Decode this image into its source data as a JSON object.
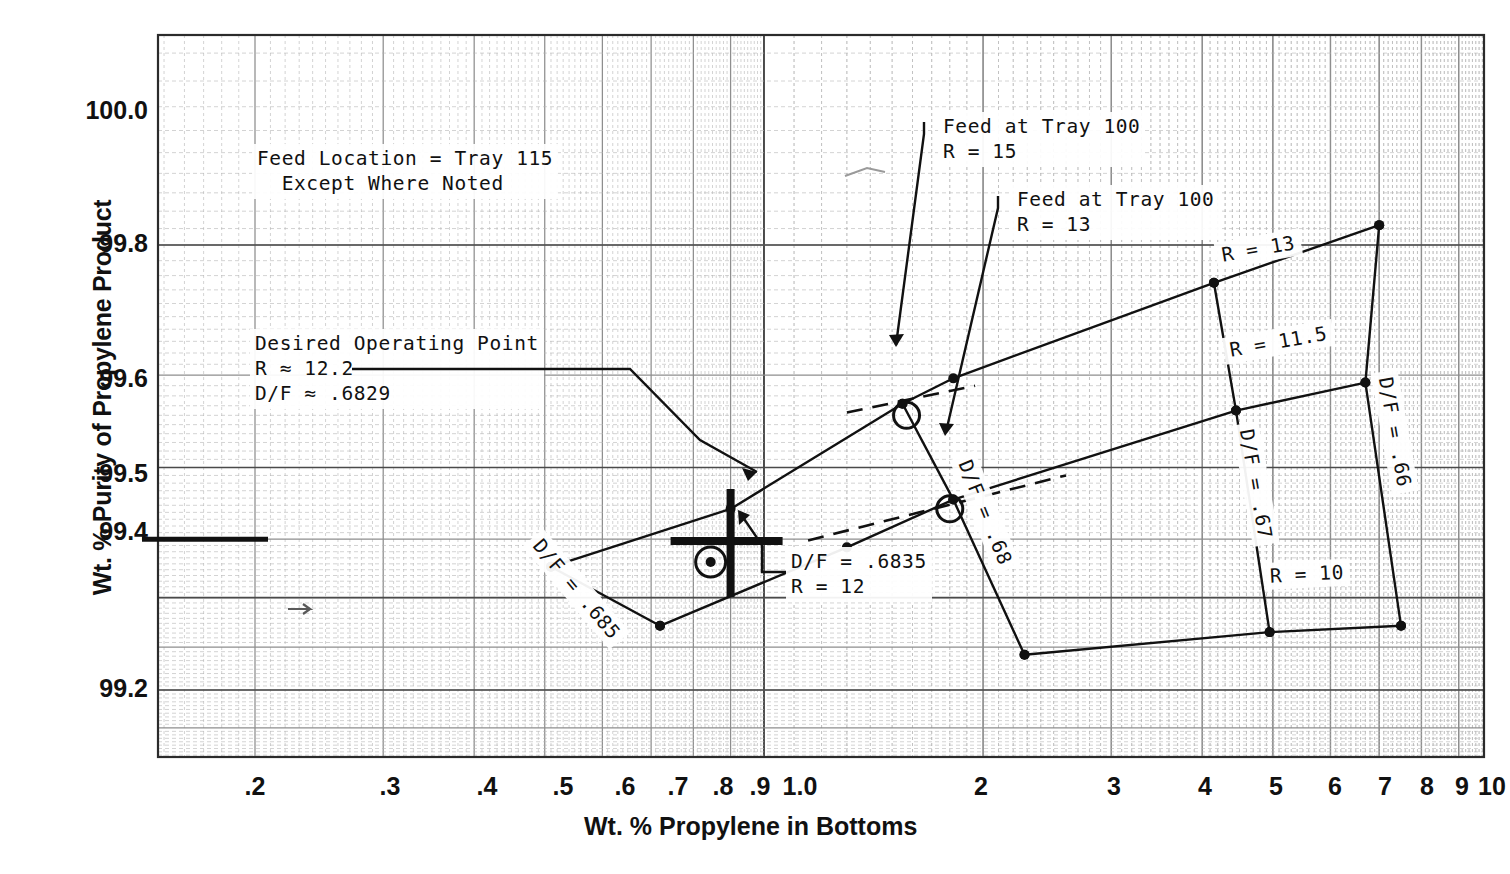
{
  "chart_data": {
    "type": "line",
    "title": "",
    "xlabel": "Wt. % Propylene in Bottoms",
    "ylabel": "Wt. % Purity of Propylene Product",
    "x_scale": "log",
    "xlim": [
      0.15,
      10
    ],
    "y_scale": "log-of-impurity",
    "ylim": [
      99.1,
      100.05
    ],
    "grid": true,
    "legend": "none",
    "x_ticks": [
      ".2",
      ".3",
      ".4",
      ".5",
      ".6",
      ".7",
      ".8",
      ".9",
      "1.0",
      "2",
      "3",
      "4",
      "5",
      "6",
      "7",
      "8",
      "9",
      "10"
    ],
    "y_ticks": [
      "100.0",
      "99.8",
      "99.6",
      "99.5",
      "99.4",
      "99.2"
    ],
    "series": [
      {
        "name": "R = 13",
        "label": "R = 13",
        "points": [
          {
            "x": 0.51,
            "y": 99.455
          },
          {
            "x": 0.9,
            "y": 99.545
          },
          {
            "x": 1.55,
            "y": 99.672
          },
          {
            "x": 1.82,
            "y": 99.697
          },
          {
            "x": 4.15,
            "y": 99.775
          },
          {
            "x": 7.0,
            "y": 99.812
          }
        ]
      },
      {
        "name": "R = 11.5",
        "label": "R = 11.5",
        "points": [
          {
            "x": 0.72,
            "y": 99.345
          },
          {
            "x": 1.3,
            "y": 99.487
          },
          {
            "x": 1.82,
            "y": 99.558
          },
          {
            "x": 4.45,
            "y": 99.665
          },
          {
            "x": 6.7,
            "y": 99.693
          }
        ]
      },
      {
        "name": "R = 10",
        "label": "R = 10",
        "points": [
          {
            "x": 2.28,
            "y": 99.283
          },
          {
            "x": 4.95,
            "y": 99.332
          },
          {
            "x": 7.5,
            "y": 99.345
          }
        ]
      },
      {
        "name": "D/F = .685",
        "label": "D/F = .685",
        "points": [
          {
            "x": 0.51,
            "y": 99.455
          },
          {
            "x": 0.72,
            "y": 99.345
          }
        ]
      },
      {
        "name": "D/F = .68",
        "label": "D/F = .68",
        "points": [
          {
            "x": 1.55,
            "y": 99.672
          },
          {
            "x": 1.82,
            "y": 99.558
          },
          {
            "x": 2.28,
            "y": 99.283
          }
        ]
      },
      {
        "name": "D/F = .67",
        "label": "D/F = .67",
        "points": [
          {
            "x": 4.15,
            "y": 99.775
          },
          {
            "x": 4.45,
            "y": 99.665
          },
          {
            "x": 4.95,
            "y": 99.332
          }
        ]
      },
      {
        "name": "D/F = .66",
        "label": "D/F = .66",
        "points": [
          {
            "x": 7.0,
            "y": 99.812
          },
          {
            "x": 6.7,
            "y": 99.693
          },
          {
            "x": 7.5,
            "y": 99.345
          }
        ]
      }
    ],
    "dashed_series": [
      {
        "name": "feed-tray-100-upper",
        "points": [
          {
            "x": 1.3,
            "y": 99.663
          },
          {
            "x": 1.95,
            "y": 99.69
          }
        ]
      },
      {
        "name": "feed-tray-100-lower",
        "points": [
          {
            "x": 1.15,
            "y": 99.498
          },
          {
            "x": 2.6,
            "y": 99.59
          }
        ]
      }
    ],
    "annotations": {
      "feed_location": "Feed Location = Tray 115\n  Except Where Noted",
      "desired_operating_point": "Desired Operating Point\nR ≈ 12.2\nD/F ≈ .6829",
      "feed_tray_100_r15": "Feed at Tray 100\nR = 15",
      "feed_tray_100_r13": "Feed at Tray 100\nR = 13",
      "df_6835_r12": "D/F = .6835\nR = 12"
    },
    "markers": {
      "desired_operating_point": {
        "symbol": "plus-cross",
        "x": 0.9,
        "y": 99.497
      },
      "circled_dot_12": {
        "symbol": "circle-dot",
        "x": 0.845,
        "y": 99.463
      },
      "circled_feed_r15": {
        "symbol": "circle-open",
        "x": 1.57,
        "y": 99.66
      },
      "circled_feed_r13": {
        "symbol": "circle-open",
        "x": 1.8,
        "y": 99.545
      }
    },
    "reference_line": {
      "name": "99.5-spec-line",
      "value": 99.5
    }
  },
  "axis": {
    "y_title": "Wt. % Purity of Propylene Product",
    "x_title": "Wt. % Propylene in Bottoms",
    "y_ticks": [
      {
        "label": "100.0",
        "y": 112
      },
      {
        "label": "99.8",
        "y": 245
      },
      {
        "label": "99.6",
        "y": 380
      },
      {
        "label": "99.5",
        "y": 475
      },
      {
        "label": "99.4",
        "y": 533
      },
      {
        "label": "99.2",
        "y": 690
      }
    ],
    "x_ticks": [
      {
        "label": ".2",
        "x": 255
      },
      {
        "label": ".3",
        "x": 390
      },
      {
        "label": ".4",
        "x": 487
      },
      {
        "label": ".5",
        "x": 563
      },
      {
        "label": ".6",
        "x": 625
      },
      {
        "label": ".7",
        "x": 678
      },
      {
        "label": ".8",
        "x": 723
      },
      {
        "label": ".9",
        "x": 760
      },
      {
        "label": "1.0",
        "x": 800
      },
      {
        "label": "2",
        "x": 981
      },
      {
        "label": "3",
        "x": 1114
      },
      {
        "label": "4",
        "x": 1205
      },
      {
        "label": "5",
        "x": 1276
      },
      {
        "label": "6",
        "x": 1335
      },
      {
        "label": "7",
        "x": 1385
      },
      {
        "label": "8",
        "x": 1427
      },
      {
        "label": "9",
        "x": 1462
      },
      {
        "label": "10",
        "x": 1492
      }
    ]
  },
  "colors": {
    "ink": "#1a1a1a",
    "grid_major": "#4a4a4a",
    "grid_minor": "#8e8e8e",
    "grid_faint": "#b5b5b5",
    "paper": "#ffffff"
  }
}
